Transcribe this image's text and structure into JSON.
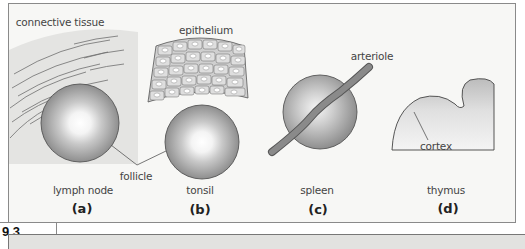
{
  "figure": {
    "number": "9.3",
    "panels": [
      {
        "name": "lymph node",
        "letter": "(a)"
      },
      {
        "name": "tonsil",
        "letter": "(b)"
      },
      {
        "name": "spleen",
        "letter": "(c)"
      },
      {
        "name": "thymus",
        "letter": "(d)"
      }
    ],
    "annotations": {
      "connective_tissue": "connective tissue",
      "epithelium": "epithelium",
      "follicle": "follicle",
      "arteriole": "arteriole",
      "cortex": "cortex"
    },
    "colors": {
      "frame_bg": "#f7f7f5",
      "connective_tissue": "#e6e6e4",
      "follicle_outer": "#9a9a9a",
      "follicle_center": "#ffffff",
      "arteriole": "#7a7a7a",
      "band": "#e2e2e0"
    }
  }
}
